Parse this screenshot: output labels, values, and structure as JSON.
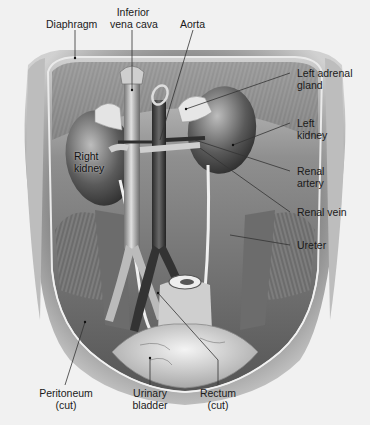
{
  "diagram": {
    "labels": {
      "diaphragm": "Diaphragm",
      "ivc_line1": "Inferior",
      "ivc_line2": "vena cava",
      "aorta": "Aorta",
      "left_adrenal_line1": "Left adrenal",
      "left_adrenal_line2": "gland",
      "left_kidney_line1": "Left",
      "left_kidney_line2": "kidney",
      "right_kidney_line1": "Right",
      "right_kidney_line2": "kidney",
      "renal_artery_line1": "Renal",
      "renal_artery_line2": "artery",
      "renal_vein": "Renal vein",
      "ureter": "Ureter",
      "peritoneum_line1": "Peritoneum",
      "peritoneum_line2": "(cut)",
      "bladder_line1": "Urinary",
      "bladder_line2": "bladder",
      "rectum_line1": "Rectum",
      "rectum_line2": "(cut)"
    },
    "colors": {
      "background": "#f1f1f1",
      "leader_line": "#333333",
      "tissue_dark": "#3a3a3a",
      "tissue_mid": "#8a8a8a",
      "tissue_light": "#d8d8d8"
    }
  }
}
